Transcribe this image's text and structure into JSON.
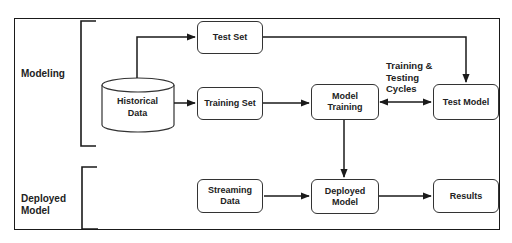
{
  "sections": {
    "modeling": "Modeling",
    "deployed_line1": "Deployed",
    "deployed_line2": "Model"
  },
  "nodes": {
    "historical_data": {
      "line1": "Historical",
      "line2": "Data",
      "shape": "cylinder"
    },
    "test_set": {
      "label": "Test Set"
    },
    "training_set": {
      "label": "Training Set"
    },
    "model_training": {
      "line1": "Model",
      "line2": "Training"
    },
    "test_model": {
      "label": "Test Model"
    },
    "streaming_data": {
      "line1": "Streaming",
      "line2": "Data"
    },
    "deployed_model": {
      "line1": "Deployed",
      "line2": "Model"
    },
    "results": {
      "label": "Results"
    }
  },
  "annotations": {
    "cycle_line1": "Training &",
    "cycle_line2": "Testing",
    "cycle_line3": "Cycles"
  },
  "edges": [
    {
      "from": "historical_data",
      "to": "test_set"
    },
    {
      "from": "historical_data",
      "to": "training_set"
    },
    {
      "from": "test_set",
      "to": "test_model"
    },
    {
      "from": "training_set",
      "to": "model_training"
    },
    {
      "from": "model_training",
      "to": "test_model",
      "bidirectional": true,
      "label": "Training & Testing Cycles"
    },
    {
      "from": "model_training",
      "to": "deployed_model"
    },
    {
      "from": "streaming_data",
      "to": "deployed_model"
    },
    {
      "from": "deployed_model",
      "to": "results"
    }
  ],
  "colors": {
    "stroke": "#1a1a1a",
    "background": "#ffffff",
    "text": "#222222"
  }
}
